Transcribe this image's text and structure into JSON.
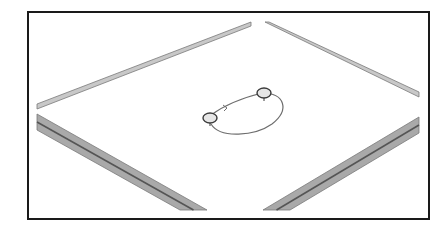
{
  "figure": {
    "frame": {
      "x": 28,
      "y": 12,
      "width": 401,
      "height": 207,
      "stroke": "#1a1a1a",
      "stroke_width": 2
    },
    "colors": {
      "background": "#ffffff",
      "rail_light": "#c8c8c8",
      "rail_mid": "#a9a9a9",
      "rail_dark": "#555555",
      "rail_edge": "#7a7a7a",
      "loop": "#6e6e6e",
      "node_fill": "#e6e6e6",
      "node_stroke": "#3a3a3a"
    },
    "rails": [
      {
        "name": "rail-top-left",
        "points": [
          [
            37,
            104
          ],
          [
            251,
            22
          ],
          [
            251,
            26
          ],
          [
            37,
            109
          ]
        ],
        "style": "thin"
      },
      {
        "name": "rail-top-right",
        "points": [
          [
            265,
            22
          ],
          [
            269,
            22
          ],
          [
            419,
            92
          ],
          [
            419,
            97
          ]
        ],
        "style": "thin"
      },
      {
        "name": "rail-bottom-left",
        "points": [
          [
            37,
            114
          ],
          [
            37,
            130
          ],
          [
            180,
            210
          ],
          [
            207,
            210
          ]
        ],
        "style": "double"
      },
      {
        "name": "rail-bottom-right",
        "points": [
          [
            263,
            210
          ],
          [
            290,
            210
          ],
          [
            419,
            133
          ],
          [
            419,
            117
          ]
        ],
        "style": "double"
      }
    ],
    "loop": {
      "path": "M211,115 C226,104 246,97 262,93 C285,93 290,110 272,124 C255,136 220,139 211,124",
      "arrow_marker": {
        "x": 226,
        "y": 108
      }
    },
    "nodes": [
      {
        "name": "node-left",
        "cx": 210,
        "cy": 118,
        "rx": 7,
        "ry": 5
      },
      {
        "name": "node-right",
        "cx": 264,
        "cy": 93,
        "rx": 7,
        "ry": 5
      }
    ]
  }
}
